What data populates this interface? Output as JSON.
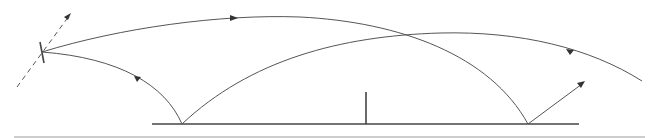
{
  "diagram": {
    "colors": {
      "stroke": "#555555",
      "ground": "#444444",
      "arrowhead": "#333333",
      "baseline_rule": "#bdbdbd",
      "background": "#ffffff"
    },
    "elements": {
      "antenna": {
        "x": 42,
        "y": 52
      },
      "ground_line": {
        "x1": 152,
        "x2": 579,
        "y": 124
      },
      "post": {
        "x": 366,
        "y1": 92,
        "y2": 124
      },
      "bounce_points": [
        {
          "x": 182,
          "y": 124
        },
        {
          "x": 528,
          "y": 124
        }
      ],
      "dashed_direction": {
        "x1": 17,
        "y1": 87,
        "x2": 71,
        "y2": 13
      },
      "outgoing_ray": {
        "x1": 528,
        "y1": 124,
        "x2": 584,
        "y2": 82
      },
      "baseline_rule": {
        "x1": 14,
        "x2": 645,
        "y": 137
      }
    },
    "paths": [
      {
        "name": "upper-arc",
        "from": "antenna",
        "to": "right-bounce",
        "arrow_at": [
          234,
          18
        ]
      },
      {
        "name": "lower-left-arc",
        "from": "left-bounce",
        "to": "antenna",
        "arrow_at": [
          137,
          78
        ]
      },
      {
        "name": "long-arc",
        "from": "left-bounce",
        "to": "right-edge",
        "arrow_at": [
          570,
          51
        ]
      }
    ]
  }
}
